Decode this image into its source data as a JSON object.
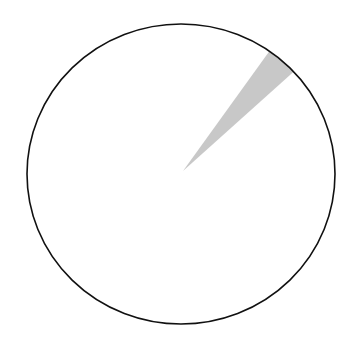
{
  "chart_data": {
    "type": "pie",
    "title": "",
    "slices": [
      {
        "label": "",
        "value": 3.3,
        "color": "#c8c8c8",
        "start_deg": 35,
        "end_deg": 47
      },
      {
        "label": "",
        "value": 96.7,
        "color": "#ffffff",
        "start_deg": 47,
        "end_deg": 395
      }
    ],
    "outline_color": "#111111",
    "legend": null,
    "start_angle": "clockwise from 12 o'clock"
  },
  "geometry": {
    "cx": 181,
    "cy": 174,
    "rx": 154,
    "ry": 150
  }
}
